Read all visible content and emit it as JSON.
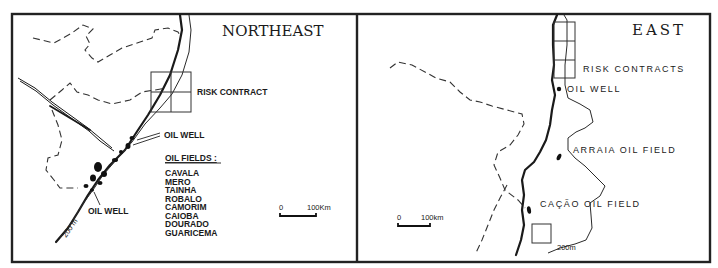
{
  "figure": {
    "panels": [
      {
        "title": "NORTHEAST",
        "labels": {
          "risk_contract": "RISK CONTRACT",
          "oil_well_upper": "OIL WELL",
          "oil_well_lower": "OIL WELL",
          "isobath": "200 m"
        },
        "oil_fields_heading": "OIL FIELDS :",
        "oil_fields": [
          "CAVALA",
          "MERO",
          "TAINHA",
          "ROBALO",
          "CAMORIM",
          "CAIOBA",
          "DOURADO",
          "GUARICEMA"
        ],
        "scale": {
          "start": "0",
          "end": "100Km"
        }
      },
      {
        "title": "EAST",
        "labels": {
          "risk_contracts": "RISK CONTRACTS",
          "oil_well": "OIL WELL",
          "arraia": "ARRAIA OIL FIELD",
          "cacao": "CAÇÃO OIL FIELD",
          "isobath": "200m"
        },
        "scale": {
          "start": "0",
          "end": "100km"
        }
      }
    ],
    "colors": {
      "ink": "#1a1a1a",
      "paper": "#ffffff"
    }
  }
}
